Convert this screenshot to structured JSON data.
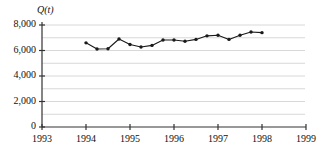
{
  "chart_data": {
    "type": "line",
    "title": "",
    "subtitle": "",
    "xlabel": "",
    "ylabel": "Q(t)",
    "ylabel_parts": {
      "symbol": "Q",
      "open": "(",
      "variable": "t",
      "close": ")"
    },
    "xlim": [
      1993,
      1999
    ],
    "ylim": [
      0,
      8000
    ],
    "grid": true,
    "grid_interval": 1000,
    "grid_color": "#d8d8d8",
    "legend": null,
    "line_color": "#1a1a1a",
    "marker": "circle",
    "marker_color": "#1a1a1a",
    "x_ticks": [
      1993,
      1994,
      1995,
      1996,
      1997,
      1998,
      1999
    ],
    "x_tick_labels": [
      "1993",
      "1994",
      "1995",
      "1996",
      "1997",
      "1998",
      "1999"
    ],
    "y_ticks": [
      0,
      2000,
      4000,
      6000,
      8000
    ],
    "y_tick_labels": [
      "0",
      "2,000",
      "4,000",
      "6,000",
      "8,000"
    ],
    "x": [
      1994.0,
      1994.25,
      1994.5,
      1994.75,
      1995.0,
      1995.25,
      1995.5,
      1995.75,
      1996.0,
      1996.25,
      1996.5,
      1996.75,
      1997.0,
      1997.25,
      1997.5,
      1997.75,
      1998.0
    ],
    "values": [
      6600,
      6120,
      6140,
      6900,
      6470,
      6270,
      6400,
      6820,
      6820,
      6730,
      6870,
      7150,
      7200,
      6870,
      7200,
      7450,
      7400
    ],
    "series": [
      {
        "name": "Q(t)",
        "x": [
          1994.0,
          1994.25,
          1994.5,
          1994.75,
          1995.0,
          1995.25,
          1995.5,
          1995.75,
          1996.0,
          1996.25,
          1996.5,
          1996.75,
          1997.0,
          1997.25,
          1997.5,
          1997.75,
          1998.0
        ],
        "values": [
          6600,
          6120,
          6140,
          6900,
          6470,
          6270,
          6400,
          6820,
          6820,
          6730,
          6870,
          7150,
          7200,
          6870,
          7200,
          7450,
          7400
        ]
      }
    ]
  },
  "axes": {
    "y_axis_name": "value-axis",
    "x_axis_name": "year-axis"
  }
}
